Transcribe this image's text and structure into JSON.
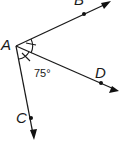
{
  "diagram": {
    "vertex": {
      "label": "A",
      "x": 16,
      "y": 46
    },
    "rays": [
      {
        "id": "AB",
        "point_label": "B",
        "end": [
          110,
          2
        ],
        "point": [
          84,
          15
        ],
        "label_pos": [
          74,
          5
        ]
      },
      {
        "id": "AD",
        "point_label": "D",
        "end": [
          118,
          91
        ],
        "point": [
          101,
          83
        ],
        "label_pos": [
          95,
          77
        ]
      },
      {
        "id": "AC",
        "point_label": "C",
        "end": [
          34,
          138
        ],
        "point": [
          31,
          118
        ],
        "label_pos": [
          16,
          123
        ]
      }
    ],
    "angle_label": "75°",
    "angle_label_pos": [
      35,
      77
    ],
    "colors": {
      "stroke": "#1a1a1a",
      "background": "#ffffff"
    }
  }
}
